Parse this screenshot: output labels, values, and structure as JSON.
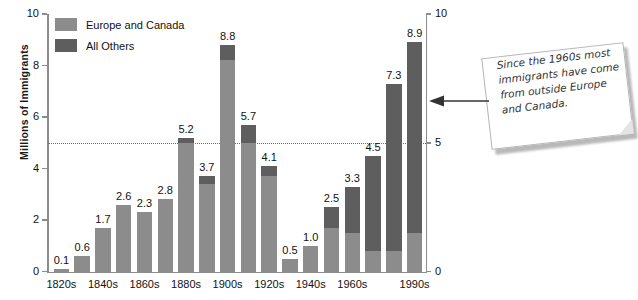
{
  "chart_data": {
    "type": "bar",
    "title": "",
    "subtitle": "",
    "xlabel": "",
    "ylabel": "Millions of Immigrants",
    "ylim": [
      0,
      10
    ],
    "yticks": [
      0,
      2,
      4,
      6,
      8,
      10
    ],
    "yticks_right": [
      0,
      5,
      10
    ],
    "grid": false,
    "stacked": true,
    "reference_line": {
      "value": 5,
      "style": "dotted"
    },
    "legend_position": "top-left",
    "categories": [
      "1820s",
      "1830s",
      "1840s",
      "1850s",
      "1860s",
      "1870s",
      "1880s",
      "1890s",
      "1900s",
      "1910s",
      "1920s",
      "1930s",
      "1940s",
      "1950s",
      "1960s",
      "1970s",
      "1980s",
      "1990s"
    ],
    "visible_tick_labels": [
      "1820s",
      "1840s",
      "1860s",
      "1880s",
      "1900s",
      "1920s",
      "1940s",
      "1960s",
      "1990s"
    ],
    "totals": [
      0.1,
      0.6,
      1.7,
      2.6,
      2.3,
      2.8,
      5.2,
      3.7,
      8.8,
      5.7,
      4.1,
      0.5,
      1.0,
      2.5,
      3.3,
      4.5,
      7.3,
      8.9
    ],
    "data_labels": [
      "0.1",
      "0.6",
      "1.7",
      "2.6",
      "2.3",
      "2.8",
      "5.2",
      "3.7",
      "8.8",
      "5.7",
      "4.1",
      "0.5",
      "1.0",
      "2.5",
      "3.3",
      "4.5",
      "7.3",
      "8.9"
    ],
    "series": [
      {
        "name": "Europe and Canada",
        "color": "#8c8c8c",
        "values": [
          0.1,
          0.6,
          1.7,
          2.6,
          2.3,
          2.8,
          5.0,
          3.4,
          8.2,
          5.0,
          3.7,
          0.5,
          1.0,
          1.7,
          1.5,
          0.8,
          0.8,
          1.5
        ]
      },
      {
        "name": "All Others",
        "color": "#5e5e5e",
        "values": [
          0.0,
          0.0,
          0.0,
          0.0,
          0.0,
          0.0,
          0.2,
          0.3,
          0.6,
          0.7,
          0.4,
          0.0,
          0.0,
          0.8,
          1.8,
          3.7,
          6.5,
          7.4
        ]
      }
    ]
  },
  "legend": {
    "items": [
      {
        "label": "Europe and Canada",
        "color": "#8c8c8c"
      },
      {
        "label": "All Others",
        "color": "#5e5e5e"
      }
    ]
  },
  "callout": {
    "text": "Since the 1960s most immigrants have come from outside Europe and Canada."
  }
}
